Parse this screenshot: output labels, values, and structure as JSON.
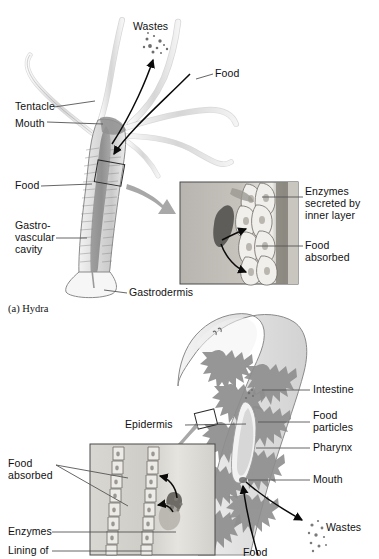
{
  "figure": {
    "background_color": "#ffffff",
    "ink_color": "#111111",
    "leader_color": "#555555",
    "gray_arrow_color": "#a8a8a8"
  },
  "panel_a": {
    "caption": "(a) Hydra",
    "organism": "hydra",
    "labels": {
      "wastes": "Wastes",
      "food_top": "Food",
      "tentacle": "Tentacle",
      "mouth": "Mouth",
      "food_left": "Food",
      "gastrovascular_line1": "Gastro-",
      "gastrovascular_line2": "vascular",
      "gastrovascular_line3": "cavity",
      "gastrodermis": "Gastrodermis"
    },
    "inset": {
      "enzymes_line1": "Enzymes",
      "enzymes_line2": "secreted by",
      "enzymes_line3": "inner layer",
      "food_absorbed_line1": "Food",
      "food_absorbed_line2": "absorbed"
    }
  },
  "panel_b": {
    "organism": "planarian",
    "labels": {
      "epidermis": "Epidermis",
      "intestine": "Intestine",
      "food_particles_line1": "Food",
      "food_particles_line2": "particles",
      "pharynx": "Pharynx",
      "mouth": "Mouth",
      "wastes": "Wastes",
      "food": "Food"
    },
    "inset": {
      "food_absorbed_line1": "Food",
      "food_absorbed_line2": "absorbed",
      "enzymes": "Enzymes",
      "lining_of": "Lining of"
    }
  }
}
